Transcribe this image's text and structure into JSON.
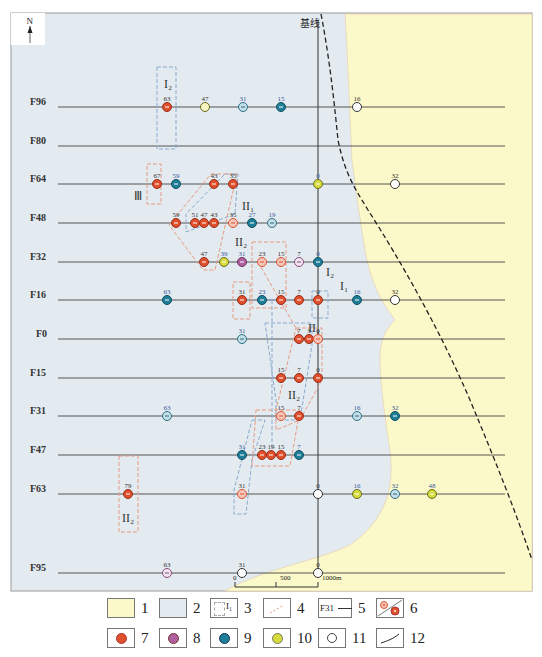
{
  "map": {
    "north_label": "N",
    "baseline_label": "基线",
    "colors": {
      "sea_yellow": "#fbf9c9",
      "land_blue": "#e3ebf0",
      "red": "#e0502d",
      "pink_outline": "#e8a08a",
      "purple": "#b060a0",
      "teal": "#1f7f99",
      "lightblue": "#7ab3c8",
      "yellow": "#d6dc3c",
      "white": "#ffffff"
    },
    "profiles": [
      {
        "name": "F96",
        "y": 107
      },
      {
        "name": "F80",
        "y": 146
      },
      {
        "name": "F64",
        "y": 184
      },
      {
        "name": "F48",
        "y": 223
      },
      {
        "name": "F32",
        "y": 262
      },
      {
        "name": "F16",
        "y": 300
      },
      {
        "name": "F0",
        "y": 339
      },
      {
        "name": "F15",
        "y": 378
      },
      {
        "name": "F31",
        "y": 416
      },
      {
        "name": "F47",
        "y": 455
      },
      {
        "name": "F63",
        "y": 494
      },
      {
        "name": "F95",
        "y": 573
      }
    ],
    "points": [
      {
        "x": 167,
        "y": 107,
        "v": "63",
        "t": "red"
      },
      {
        "x": 205,
        "y": 107,
        "v": "47",
        "t": "yellow-outline"
      },
      {
        "x": 243,
        "y": 107,
        "v": "31",
        "t": "lightblue"
      },
      {
        "x": 281,
        "y": 107,
        "v": "15",
        "t": "teal"
      },
      {
        "x": 357,
        "y": 107,
        "v": "16",
        "t": "white"
      },
      {
        "x": 157,
        "y": 184,
        "v": "67",
        "t": "red"
      },
      {
        "x": 176,
        "y": 184,
        "v": "59",
        "t": "teal"
      },
      {
        "x": 214,
        "y": 184,
        "v": "43",
        "t": "red"
      },
      {
        "x": 233,
        "y": 184,
        "v": "35",
        "t": "red"
      },
      {
        "x": 318,
        "y": 184,
        "v": "0",
        "t": "yellow"
      },
      {
        "x": 395,
        "y": 184,
        "v": "32",
        "t": "white"
      },
      {
        "x": 176,
        "y": 223,
        "v": "59",
        "t": "red"
      },
      {
        "x": 195,
        "y": 223,
        "v": "51",
        "t": "red"
      },
      {
        "x": 204,
        "y": 223,
        "v": "47",
        "t": "red"
      },
      {
        "x": 214,
        "y": 223,
        "v": "43",
        "t": "red"
      },
      {
        "x": 233,
        "y": 223,
        "v": "35",
        "t": "pink"
      },
      {
        "x": 252,
        "y": 223,
        "v": "27",
        "t": "teal"
      },
      {
        "x": 272,
        "y": 223,
        "v": "19",
        "t": "lightblue"
      },
      {
        "x": 204,
        "y": 262,
        "v": "47",
        "t": "red"
      },
      {
        "x": 224,
        "y": 262,
        "v": "39",
        "t": "yellow"
      },
      {
        "x": 242,
        "y": 262,
        "v": "31",
        "t": "purple"
      },
      {
        "x": 262,
        "y": 262,
        "v": "23",
        "t": "pink"
      },
      {
        "x": 281,
        "y": 262,
        "v": "15",
        "t": "pink"
      },
      {
        "x": 299,
        "y": 262,
        "v": "7",
        "t": "purple-outline"
      },
      {
        "x": 318,
        "y": 262,
        "v": "0",
        "t": "teal"
      },
      {
        "x": 167,
        "y": 300,
        "v": "63",
        "t": "teal"
      },
      {
        "x": 242,
        "y": 300,
        "v": "31",
        "t": "red"
      },
      {
        "x": 262,
        "y": 300,
        "v": "23",
        "t": "teal"
      },
      {
        "x": 281,
        "y": 300,
        "v": "15",
        "t": "red"
      },
      {
        "x": 299,
        "y": 300,
        "v": "7",
        "t": "red"
      },
      {
        "x": 318,
        "y": 300,
        "v": "0",
        "t": "red"
      },
      {
        "x": 357,
        "y": 300,
        "v": "16",
        "t": "teal"
      },
      {
        "x": 395,
        "y": 300,
        "v": "32",
        "t": "white"
      },
      {
        "x": 242,
        "y": 339,
        "v": "31",
        "t": "lightblue"
      },
      {
        "x": 299,
        "y": 339,
        "v": "7",
        "t": "red"
      },
      {
        "x": 309,
        "y": 339,
        "v": "3",
        "t": "red"
      },
      {
        "x": 318,
        "y": 339,
        "v": "0",
        "t": "pink"
      },
      {
        "x": 281,
        "y": 378,
        "v": "15",
        "t": "red"
      },
      {
        "x": 299,
        "y": 378,
        "v": "7",
        "t": "red"
      },
      {
        "x": 318,
        "y": 378,
        "v": "0",
        "t": "red"
      },
      {
        "x": 167,
        "y": 416,
        "v": "63",
        "t": "lightblue"
      },
      {
        "x": 281,
        "y": 416,
        "v": "15",
        "t": "pink"
      },
      {
        "x": 299,
        "y": 416,
        "v": "7",
        "t": "red"
      },
      {
        "x": 357,
        "y": 416,
        "v": "16",
        "t": "lightblue"
      },
      {
        "x": 395,
        "y": 416,
        "v": "32",
        "t": "teal"
      },
      {
        "x": 242,
        "y": 455,
        "v": "31",
        "t": "teal"
      },
      {
        "x": 262,
        "y": 455,
        "v": "23",
        "t": "red"
      },
      {
        "x": 271,
        "y": 455,
        "v": "19",
        "t": "red"
      },
      {
        "x": 281,
        "y": 455,
        "v": "15",
        "t": "red"
      },
      {
        "x": 299,
        "y": 455,
        "v": "7",
        "t": "teal"
      },
      {
        "x": 128,
        "y": 494,
        "v": "79",
        "t": "red"
      },
      {
        "x": 242,
        "y": 494,
        "v": "31",
        "t": "pink"
      },
      {
        "x": 318,
        "y": 494,
        "v": "0",
        "t": "white"
      },
      {
        "x": 357,
        "y": 494,
        "v": "16",
        "t": "yellow"
      },
      {
        "x": 395,
        "y": 494,
        "v": "32",
        "t": "lightblue"
      },
      {
        "x": 432,
        "y": 494,
        "v": "48",
        "t": "yellow"
      },
      {
        "x": 167,
        "y": 573,
        "v": "63",
        "t": "purple-outline"
      },
      {
        "x": 242,
        "y": 573,
        "v": "31",
        "t": "white"
      },
      {
        "x": 318,
        "y": 573,
        "v": "0",
        "t": "white"
      }
    ],
    "zone_labels": [
      {
        "text": "I₂",
        "x": 170,
        "y": 88
      },
      {
        "text": "Ⅲ",
        "x": 140,
        "y": 200
      },
      {
        "text": "II₁",
        "x": 248,
        "y": 210
      },
      {
        "text": "II₂",
        "x": 241,
        "y": 246
      },
      {
        "text": "I₂",
        "x": 332,
        "y": 276
      },
      {
        "text": "I₁",
        "x": 346,
        "y": 290
      },
      {
        "text": "II₁",
        "x": 314,
        "y": 332
      },
      {
        "text": "II₂",
        "x": 294,
        "y": 399
      },
      {
        "text": "II₂",
        "x": 128,
        "y": 522
      }
    ],
    "scale_bar": {
      "labels": [
        "0",
        "500",
        "1000m"
      ]
    }
  },
  "legend": {
    "items": [
      {
        "num": "1",
        "desc": "sea-area"
      },
      {
        "num": "2",
        "desc": "land-area"
      },
      {
        "num": "3",
        "desc": "zone-boundary",
        "zone_text": "I₁"
      },
      {
        "num": "4",
        "desc": "zone-link-line"
      },
      {
        "num": "5",
        "desc": "profile-line",
        "text": "F31"
      },
      {
        "num": "6",
        "desc": "point-pair"
      },
      {
        "num": "7",
        "desc": "red-point"
      },
      {
        "num": "8",
        "desc": "purple-point"
      },
      {
        "num": "9",
        "desc": "teal-point"
      },
      {
        "num": "10",
        "desc": "yellow-point"
      },
      {
        "num": "11",
        "desc": "white-point"
      },
      {
        "num": "12",
        "desc": "baseline-curve"
      }
    ]
  }
}
